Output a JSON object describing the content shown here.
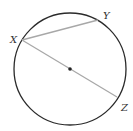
{
  "diagram": {
    "type": "circle-geometry",
    "circle": {
      "cx": 70,
      "cy": 69,
      "r": 56,
      "stroke": "#2a2a2a"
    },
    "center": {
      "x": 70,
      "y": 69
    },
    "points": [
      {
        "name": "X",
        "x": 22,
        "y": 40,
        "label_x": 10,
        "label_y": 43
      },
      {
        "name": "Y",
        "x": 98,
        "y": 20,
        "label_x": 103,
        "label_y": 19
      },
      {
        "name": "Z",
        "x": 117,
        "y": 97,
        "label_x": 121,
        "label_y": 111
      }
    ],
    "segments": [
      {
        "from": "X",
        "to": "Y",
        "kind": "chord",
        "stroke": "#a8a8a8"
      },
      {
        "from": "X",
        "to": "Z",
        "kind": "diameter",
        "stroke": "#a8a8a8"
      }
    ],
    "labels": {
      "x": "X",
      "y": "Y",
      "z": "Z"
    }
  }
}
